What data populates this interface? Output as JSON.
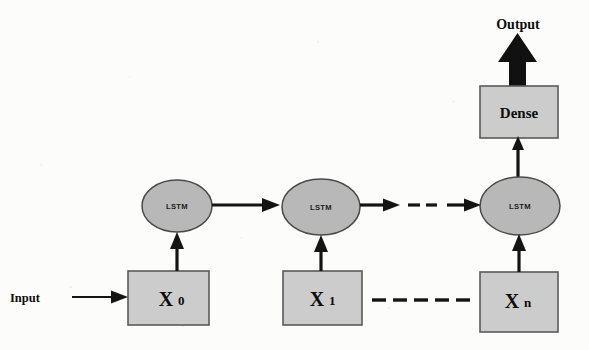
{
  "diagram": {
    "type": "flow-diagram",
    "colors": {
      "box_fill": "#cccccc",
      "box_stroke": "#5a5a5a",
      "ellipse_fill": "#b8b8b8",
      "ellipse_stroke": "#4a4a4a",
      "arrow": "#141414",
      "background": "#fcfcfb",
      "text": "#0d0d0d"
    },
    "labels": {
      "input": "Input",
      "output": "Output",
      "dense": "Dense"
    },
    "input_nodes": [
      {
        "base": "X",
        "sub": "0"
      },
      {
        "base": "X",
        "sub": "1"
      },
      {
        "base": "X",
        "sub": "n"
      }
    ],
    "cells": [
      {
        "label": "LSTM"
      },
      {
        "label": "LSTM"
      },
      {
        "label": "LSTM"
      }
    ],
    "ellipsis": {
      "cell_row": "- -",
      "input_row": "- - - - - - -"
    }
  }
}
